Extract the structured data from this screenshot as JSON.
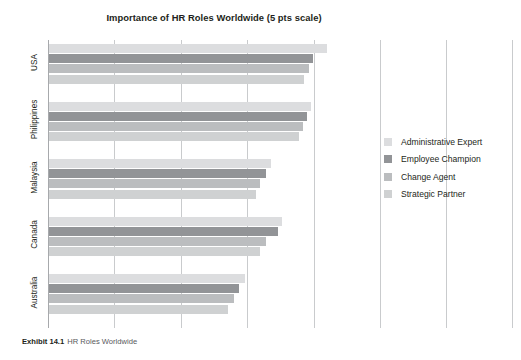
{
  "figure": {
    "caption_number": "Exhibit 14.1",
    "caption_text": "HR Roles Worldwide"
  },
  "chart_data": {
    "type": "bar",
    "orientation": "horizontal",
    "title": "Importance of HR Roles Worldwide (5 pts scale)",
    "xlabel": "",
    "ylabel": "",
    "xlim": [
      0,
      5
    ],
    "xticks": [
      0,
      1,
      2,
      3,
      4,
      5
    ],
    "xtick_labels": [
      "",
      "",
      "",
      "",
      "",
      ""
    ],
    "grid": true,
    "legend_position": "right",
    "categories": [
      "USA",
      "Philippines",
      "Malaysia",
      "Canada",
      "Australia"
    ],
    "series": [
      {
        "name": "Administrative Expert",
        "color": "#dcdddf",
        "values": [
          4.19,
          3.95,
          3.34,
          3.51,
          2.95
        ]
      },
      {
        "name": "Employee Champion",
        "color": "#929497",
        "values": [
          3.98,
          3.89,
          3.27,
          3.45,
          2.86
        ]
      },
      {
        "name": "Change Agent",
        "color": "#bbbdbf",
        "values": [
          3.92,
          3.83,
          3.18,
          3.27,
          2.79
        ]
      },
      {
        "name": "Strategic Partner",
        "color": "#cfd1d2",
        "values": [
          3.84,
          3.77,
          3.12,
          3.18,
          2.7
        ]
      }
    ]
  }
}
